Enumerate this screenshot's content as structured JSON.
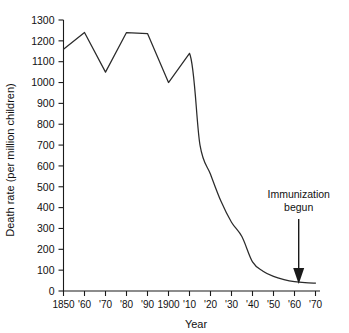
{
  "chart_data": {
    "type": "line",
    "title": "",
    "xlabel": "Year",
    "ylabel": "Death rate (per million children)",
    "xlim": [
      1850,
      1970
    ],
    "ylim": [
      0,
      1300
    ],
    "grid": false,
    "legend": null,
    "x_tick_labels": [
      "1850",
      "'60",
      "'70",
      "'80",
      "'90",
      "1900",
      "'10",
      "'20",
      "'30",
      "'40",
      "'50",
      "'60",
      "'70"
    ],
    "x_tick_values": [
      1850,
      1860,
      1870,
      1880,
      1890,
      1900,
      1910,
      1920,
      1930,
      1940,
      1950,
      1960,
      1970
    ],
    "y_tick_labels": [
      "0",
      "100",
      "200",
      "300",
      "400",
      "500",
      "600",
      "700",
      "800",
      "900",
      "1000",
      "1100",
      "1200",
      "1300"
    ],
    "y_tick_values": [
      0,
      100,
      200,
      300,
      400,
      500,
      600,
      700,
      800,
      900,
      1000,
      1100,
      1200,
      1300
    ],
    "x": [
      1850,
      1860,
      1870,
      1880,
      1890,
      1900,
      1910,
      1915,
      1920,
      1925,
      1930,
      1935,
      1940,
      1945,
      1950,
      1955,
      1960,
      1965,
      1970
    ],
    "values": [
      1160,
      1240,
      1050,
      1240,
      1235,
      1000,
      1140,
      700,
      560,
      430,
      330,
      260,
      140,
      95,
      70,
      55,
      45,
      40,
      38
    ],
    "series_name": "Death rate",
    "line_color": "#2b2b2b",
    "annotations": [
      {
        "name": "immunization-begun",
        "text_line1": "Immunization",
        "text_line2": "begun",
        "arrow_x_value": 1962,
        "arrow_direction": "down"
      }
    ]
  },
  "axes": {
    "y_title": "Death rate (per million children)",
    "x_title": "Year"
  }
}
